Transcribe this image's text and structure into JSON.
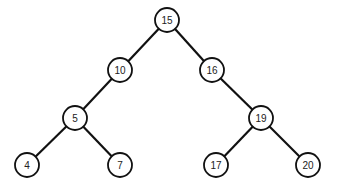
{
  "diagram": {
    "type": "binary-search-tree",
    "colors": {
      "stroke": "#111111",
      "fill": "#ffffff",
      "text": "#222222"
    },
    "nodes": [
      {
        "id": "n15",
        "label": "15",
        "x": 167,
        "y": 20
      },
      {
        "id": "n10",
        "label": "10",
        "x": 120,
        "y": 70
      },
      {
        "id": "n16",
        "label": "16",
        "x": 212,
        "y": 70
      },
      {
        "id": "n5",
        "label": "5",
        "x": 75,
        "y": 118
      },
      {
        "id": "n19",
        "label": "19",
        "x": 261,
        "y": 118
      },
      {
        "id": "n4",
        "label": "4",
        "x": 27,
        "y": 165
      },
      {
        "id": "n7",
        "label": "7",
        "x": 120,
        "y": 165
      },
      {
        "id": "n17",
        "label": "17",
        "x": 216,
        "y": 165
      },
      {
        "id": "n20",
        "label": "20",
        "x": 308,
        "y": 165
      }
    ],
    "edges": [
      {
        "from": "n15",
        "to": "n10"
      },
      {
        "from": "n15",
        "to": "n16"
      },
      {
        "from": "n10",
        "to": "n5"
      },
      {
        "from": "n16",
        "to": "n19"
      },
      {
        "from": "n5",
        "to": "n4"
      },
      {
        "from": "n5",
        "to": "n7"
      },
      {
        "from": "n19",
        "to": "n17"
      },
      {
        "from": "n19",
        "to": "n20"
      }
    ]
  }
}
